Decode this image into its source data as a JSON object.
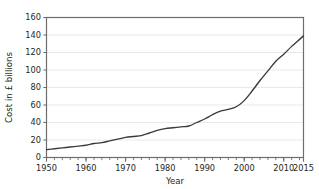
{
  "chart_data": {
    "type": "line",
    "title": "",
    "xlabel": "Year",
    "ylabel": "Cost in £ billions",
    "xlim": [
      1950,
      2015
    ],
    "ylim": [
      0,
      160
    ],
    "grid": true,
    "grid_axis": "y",
    "legend": "none",
    "line_color": "#3a3a3a",
    "grid_color": "#e9e9e9",
    "axis_color": "#6d6d6d",
    "x_major_ticks": [
      1950,
      1960,
      1970,
      1980,
      1990,
      2000,
      2010,
      2015
    ],
    "x_major_tick_labels": [
      "1950",
      "1960",
      "1970",
      "1980",
      "1990",
      "2000",
      "2010",
      "2015"
    ],
    "x_minor_tick_step": 2,
    "y_ticks": [
      0,
      20,
      40,
      60,
      80,
      100,
      120,
      140,
      160
    ],
    "y_tick_labels": [
      "0",
      "20",
      "40",
      "60",
      "80",
      "100",
      "120",
      "140",
      "160"
    ],
    "x": [
      1950,
      1952,
      1954,
      1956,
      1958,
      1960,
      1962,
      1964,
      1966,
      1968,
      1970,
      1972,
      1974,
      1976,
      1978,
      1980,
      1982,
      1984,
      1986,
      1988,
      1990,
      1992,
      1994,
      1996,
      1998,
      2000,
      2002,
      2004,
      2006,
      2008,
      2010,
      2012,
      2014,
      2015
    ],
    "values": [
      9,
      10,
      11,
      12,
      13,
      14,
      16,
      17,
      19,
      21,
      23,
      24,
      25,
      28,
      31,
      33,
      34,
      35,
      36,
      40,
      44,
      49,
      53,
      55,
      58,
      65,
      76,
      88,
      99,
      110,
      118,
      127,
      135,
      139
    ]
  }
}
